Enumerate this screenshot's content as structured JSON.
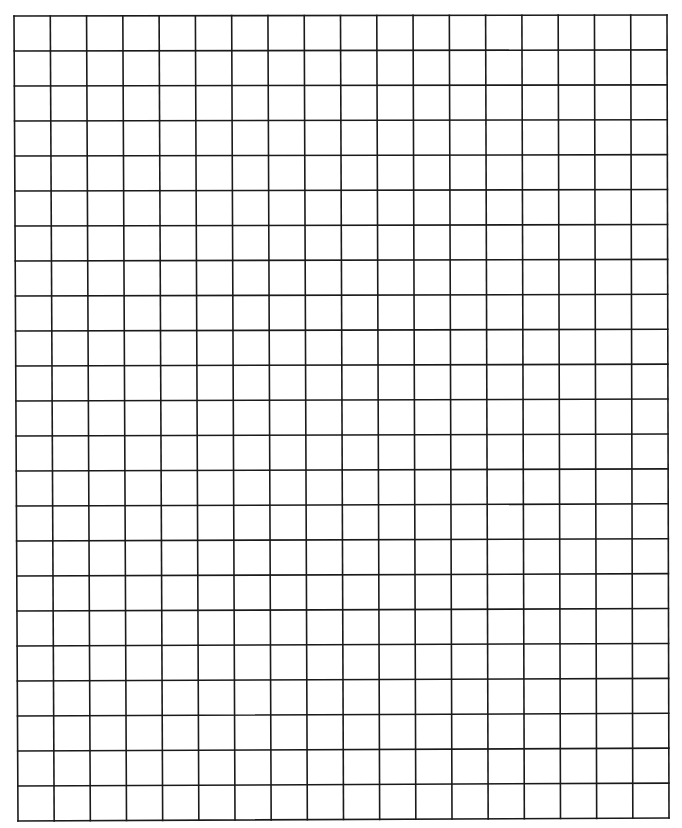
{
  "page": {
    "width": 682,
    "height": 828,
    "background": "#ffffff"
  },
  "grid": {
    "columns": 18,
    "rows": 23,
    "line_color": "#1a1a1a",
    "line_width": 1.6,
    "corners": {
      "top_left": [
        14,
        16
      ],
      "top_right": [
        667,
        15
      ],
      "bottom_left": [
        18,
        821
      ],
      "bottom_right": [
        669,
        818
      ]
    },
    "cells_empty": true
  }
}
